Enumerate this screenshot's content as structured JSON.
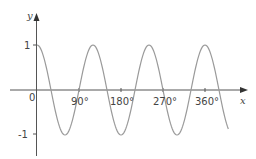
{
  "chart_data": {
    "type": "line",
    "title": "",
    "xlabel": "x",
    "ylabel": "y",
    "function": "y = cos 3x",
    "x_ticks": [
      90,
      180,
      270,
      360
    ],
    "x_tick_labels": [
      "90°",
      "180°",
      "270°",
      "360°"
    ],
    "y_ticks": [
      1,
      -1
    ],
    "y_tick_labels": [
      "1",
      "-1"
    ],
    "origin_label": "0",
    "xlim": [
      0,
      410
    ],
    "ylim": [
      -1.5,
      1.5
    ],
    "grid": false,
    "legend": null,
    "series": [
      {
        "name": "cos 3x",
        "x": [
          0,
          30,
          60,
          90,
          120,
          150,
          180,
          210,
          240,
          270,
          300,
          330,
          360,
          390,
          410
        ],
        "values": [
          1,
          0,
          -1,
          0,
          1,
          0,
          -1,
          0,
          1,
          0,
          -1,
          0,
          1,
          0,
          -0.94
        ]
      }
    ],
    "colors": {
      "curve": "#9a9a9a",
      "axes": "#555555",
      "text": "#444444"
    }
  },
  "labels": {
    "y_axis": "y",
    "x_axis": "x",
    "origin": "0",
    "y_one": "1",
    "y_neg_one": "-1",
    "x90": "90°",
    "x180": "180°",
    "x270": "270°",
    "x360": "360°"
  }
}
